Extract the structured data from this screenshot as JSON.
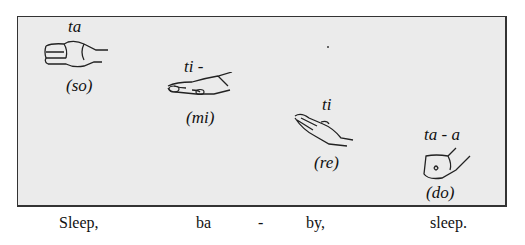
{
  "diagram": {
    "title": "",
    "background_color": "#ebebeb",
    "border_color": "#333333",
    "steps": [
      {
        "syllable": "ta",
        "solfege": "(so)",
        "hand_sign": "flat-hand-horizontal"
      },
      {
        "syllable": "ti -",
        "solfege": "(mi)",
        "hand_sign": "flat-hand-palm-down"
      },
      {
        "syllable": "ti",
        "solfege": "(re)",
        "hand_sign": "hand-tilted-up"
      },
      {
        "syllable": "ta - a",
        "solfege": "(do)",
        "hand_sign": "closed-fist"
      }
    ]
  },
  "lyrics": [
    "Sleep,",
    "ba",
    "-",
    "by,",
    "sleep."
  ]
}
